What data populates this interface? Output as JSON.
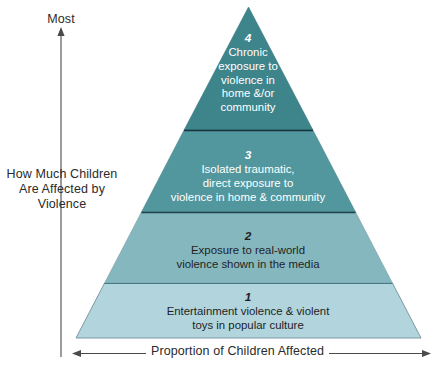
{
  "diagram": {
    "type": "pyramid",
    "title": "",
    "axes": {
      "y_top_label": "Most",
      "y_axis_label_lines": [
        "How Much Children",
        "Are Affected by",
        "Violence"
      ],
      "x_axis_label": "Proportion of Children Affected",
      "y_arrow_direction": "up",
      "x_arrow_direction": "both"
    },
    "tiers": [
      {
        "number": "4",
        "lines": [
          "Chronic",
          "exposure to",
          "violence in",
          "home &/or",
          "community"
        ],
        "fill": "#3d848b",
        "text_color": "#ffffff",
        "position": "top"
      },
      {
        "number": "3",
        "lines": [
          "Isolated traumatic,",
          "direct exposure to",
          "violence in home & community"
        ],
        "fill": "#52979d",
        "text_color": "#ffffff",
        "position": "upper-middle"
      },
      {
        "number": "2",
        "lines": [
          "Exposure to real-world",
          "violence shown in the media"
        ],
        "fill": "#85b7bf",
        "text_color": "#1f1f1f",
        "position": "lower-middle"
      },
      {
        "number": "1",
        "lines": [
          "Entertainment violence & violent",
          "toys in popular culture"
        ],
        "fill": "#b1d4dd",
        "text_color": "#1f1f1f",
        "position": "base"
      }
    ],
    "colors": {
      "axis": "#4a4a4a",
      "divider": "#1f3f45",
      "outline": "#7d9aa2",
      "background": "#ffffff"
    }
  }
}
